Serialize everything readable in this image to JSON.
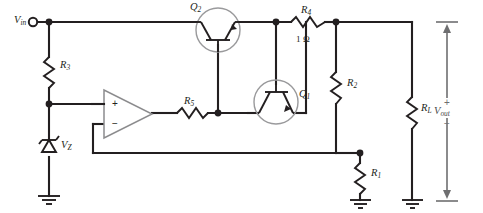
{
  "diagram": {
    "type": "schematic"
  },
  "terminals": {
    "input": {
      "label": "V",
      "sub": "in",
      "x": 14,
      "y": 15
    },
    "output": {
      "label": "V",
      "sub": "out",
      "x": 440,
      "y": 105
    },
    "output_plus": "+",
    "output_minus": "−"
  },
  "components": [
    {
      "name": "R3",
      "label": "R",
      "sub": "3",
      "value": "",
      "kind": "resistor"
    },
    {
      "name": "R5",
      "label": "R",
      "sub": "5",
      "value": "",
      "kind": "resistor"
    },
    {
      "name": "R4",
      "label": "R",
      "sub": "4",
      "value": "1 Ω",
      "kind": "resistor"
    },
    {
      "name": "R2",
      "label": "R",
      "sub": "2",
      "value": "",
      "kind": "resistor"
    },
    {
      "name": "R1",
      "label": "R",
      "sub": "1",
      "value": "",
      "kind": "resistor"
    },
    {
      "name": "RL",
      "label": "R",
      "sub": "L",
      "value": "",
      "kind": "resistor"
    },
    {
      "name": "Q1",
      "label": "Q",
      "sub": "1",
      "value": "",
      "kind": "transistor"
    },
    {
      "name": "Q2",
      "label": "Q",
      "sub": "2",
      "value": "",
      "kind": "transistor"
    },
    {
      "name": "VZ",
      "label": "V",
      "sub": "Z",
      "value": "",
      "kind": "zener-diode"
    },
    {
      "name": "opamp",
      "label": "",
      "sub": "",
      "value": "",
      "kind": "op-amp"
    }
  ],
  "opamp": {
    "noninverting_label": "+",
    "inverting_label": "−"
  },
  "colors": {
    "wire": "#231f20",
    "component_outline": "#9a9a9c",
    "annotation": "#6e6e70",
    "background": "#ffffff"
  }
}
